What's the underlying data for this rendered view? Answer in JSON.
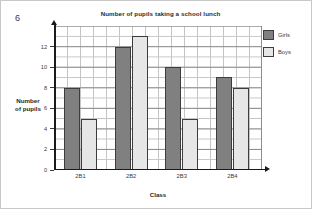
{
  "question_number": "6",
  "chart_data": {
    "type": "bar",
    "title": "Number of pupils taking a school lunch",
    "xlabel": "Class",
    "ylabel": "Number of pupils",
    "categories": [
      "2B1",
      "2B2",
      "2B3",
      "2B4"
    ],
    "series": [
      {
        "name": "Girls",
        "color": "#808080",
        "values": [
          8,
          12,
          10,
          9
        ]
      },
      {
        "name": "Boys",
        "color": "#e6e6e6",
        "values": [
          5,
          13,
          5,
          8
        ]
      }
    ],
    "ylim": [
      0,
      14
    ],
    "yticks": [
      0,
      2,
      4,
      6,
      8,
      10,
      12
    ],
    "ytick_labels": [
      "0",
      "2",
      "4",
      "6",
      "8",
      "10",
      "12"
    ],
    "grid": true,
    "grid_minor_step": 1,
    "grid_major_step": 2,
    "legend_position": "right"
  },
  "axis": {
    "y_title_line1": "Number",
    "y_title_line2": "of pupils"
  }
}
